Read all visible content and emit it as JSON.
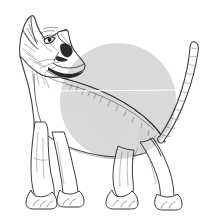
{
  "figure": {
    "title": "Cat line drawing with grey circle overlay",
    "caption": "Pen and ink line drawing of a slender oriental shorthair cat standing in profile, head raised and turned upward to the left, with a large light grey translucent circle overlaid across its torso and a thin white horizontal line crossing the circle.",
    "background_color": "#ffffff",
    "width": 213,
    "height": 221
  },
  "subject": {
    "name": "cat",
    "breed_type": "oriental shorthair / siamese type",
    "pose": "standing, head raised looking up to the left",
    "line_color": "#3a3a3a",
    "fill_color": "#ffffff",
    "parts": [
      {
        "name": "left-ear",
        "label": "Left ear"
      },
      {
        "name": "right-ear",
        "label": "Right ear"
      },
      {
        "name": "head",
        "label": "Head"
      },
      {
        "name": "eye",
        "label": "Eye"
      },
      {
        "name": "muzzle",
        "label": "Muzzle and nose"
      },
      {
        "name": "neck-collar-marking",
        "label": "Dark neck marking"
      },
      {
        "name": "chest",
        "label": "Chest"
      },
      {
        "name": "back",
        "label": "Back and spine"
      },
      {
        "name": "belly",
        "label": "Belly"
      },
      {
        "name": "front-legs",
        "label": "Front legs"
      },
      {
        "name": "hind-legs",
        "label": "Hind legs"
      },
      {
        "name": "paws",
        "label": "Paws"
      },
      {
        "name": "tail",
        "label": "Tail"
      }
    ]
  },
  "overlay_circle": {
    "label": "Grey circle overlay",
    "center_x": 118,
    "center_y": 101,
    "radius": 58,
    "fill_color": "#d2d2d2",
    "opacity": 0.85,
    "stroke": "none"
  },
  "overlay_line": {
    "label": "White horizontal line",
    "x1": 60,
    "y1": 91,
    "x2": 178,
    "y2": 90,
    "stroke_color": "#ffffff",
    "stroke_width": 1.2
  },
  "chart_data": {
    "type": "scatter",
    "title": "Cat line drawing with grey circle overlay",
    "xlabel": "",
    "ylabel": "",
    "xlim": [
      0,
      213
    ],
    "ylim": [
      0,
      221
    ],
    "grid": false,
    "legend": null,
    "annotations": [
      {
        "name": "grey-circle",
        "shape": "circle",
        "cx": 118,
        "cy": 101,
        "r": 58,
        "color": "#d2d2d2"
      },
      {
        "name": "white-line",
        "shape": "line",
        "x1": 60,
        "y1": 91,
        "x2": 178,
        "y2": 90,
        "color": "#ffffff"
      }
    ]
  }
}
